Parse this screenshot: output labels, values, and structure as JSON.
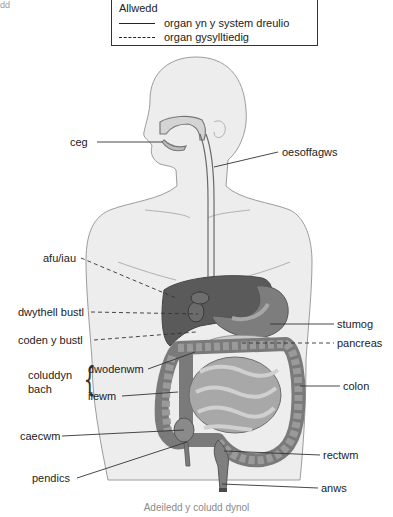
{
  "corner_text": "dd",
  "key": {
    "title": "Allwedd",
    "items": [
      {
        "style": "solid",
        "label": "organ yn y system dreulio"
      },
      {
        "style": "dashed",
        "label": "organ gysylltiedig"
      }
    ]
  },
  "labels": {
    "ceg": "ceg",
    "oesoffagws": "oesoffagws",
    "afu": "afu/iau",
    "dwythell": "dwythell bustl",
    "coden": "coden y bustl",
    "coluddyn_bach_1": "coluddyn",
    "coluddyn_bach_2": "bach",
    "dwodenwm": "dwodenwm",
    "ilewm": "ilewm",
    "caecwm": "caecwm",
    "pendics": "pendics",
    "stumog": "stumog",
    "pancreas": "pancreas",
    "colon": "colon",
    "rectwm": "rectwm",
    "anws": "anws"
  },
  "caption": "Adeiledd y coludd dynol",
  "colors": {
    "body_fill": "#ededed",
    "body_outline": "#9c9c9c",
    "liver": "#5a5a5a",
    "stomach": "#7d7d7d",
    "intestine": "#8f8f8f",
    "leader_line": "#333333"
  }
}
